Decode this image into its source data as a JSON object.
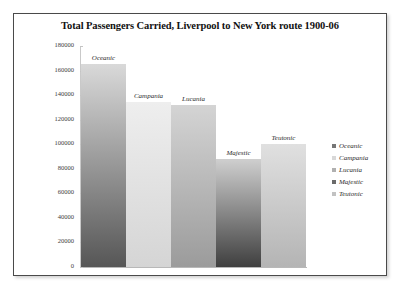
{
  "chart_data": {
    "type": "bar",
    "title": "Total Passengers Carried, Liverpool to New York route 1900-06",
    "xlabel": "",
    "ylabel": "",
    "ylim": [
      0,
      180000
    ],
    "ytick_step": 20000,
    "yticks": [
      "180000",
      "160000",
      "140000",
      "120000",
      "100000",
      "80000",
      "60000",
      "40000",
      "20000",
      "0"
    ],
    "grid": false,
    "legend_position": "right",
    "categories": [
      "Oceanic",
      "Campania",
      "Lucania",
      "Majestic",
      "Teutonic"
    ],
    "values": [
      165000,
      134000,
      132000,
      88000,
      100000
    ],
    "series": [
      {
        "name": "Total Passengers Carried",
        "values": [
          165000,
          134000,
          132000,
          88000,
          100000
        ]
      }
    ],
    "bars": [
      {
        "label": "Oceanic",
        "value": 165000,
        "color_top": "#d9d9d9",
        "color_bottom": "#565656",
        "swatch": "#767676"
      },
      {
        "label": "Campania",
        "value": 134000,
        "color_top": "#eeeeee",
        "color_bottom": "#d5d5d5",
        "swatch": "#d8d8d8"
      },
      {
        "label": "Lucania",
        "value": 132000,
        "color_top": "#d4d4d4",
        "color_bottom": "#9b9b9b",
        "swatch": "#b0b0b0"
      },
      {
        "label": "Majestic",
        "value": 88000,
        "color_top": "#cfcfcf",
        "color_bottom": "#3f3f3f",
        "swatch": "#6a6a6a"
      },
      {
        "label": "Teutonic",
        "value": 100000,
        "color_top": "#e0e0e0",
        "color_bottom": "#b4b4b4",
        "swatch": "#c2c2c2"
      }
    ],
    "legend": [
      {
        "label": "Oceanic",
        "color": "#767676"
      },
      {
        "label": "Campania",
        "color": "#d8d8d8"
      },
      {
        "label": "Lucania",
        "color": "#b0b0b0"
      },
      {
        "label": "Majestic",
        "color": "#6a6a6a"
      },
      {
        "label": "Teutonic",
        "color": "#c2c2c2"
      }
    ]
  }
}
